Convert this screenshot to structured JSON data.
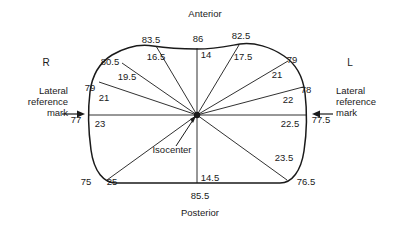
{
  "figure": {
    "type": "body-contour-diagram",
    "orientation_labels": {
      "anterior": "Anterior",
      "posterior": "Posterior",
      "right": "R",
      "left": "L"
    },
    "isocenter_label": "Isocenter",
    "reference_marks": {
      "left": {
        "line1": "Lateral",
        "line2": "reference",
        "line3": "mark",
        "value": "77"
      },
      "right": {
        "line1": "Lateral",
        "line2": "reference",
        "line3": "mark",
        "value": "77.5"
      }
    },
    "outer_measurements": [
      {
        "name": "anterior-left-outer-80_5",
        "value": "80.5"
      },
      {
        "name": "anterior-left-outer-83_5",
        "value": "83.5"
      },
      {
        "name": "anterior-top-86",
        "value": "86"
      },
      {
        "name": "anterior-right-outer-82_5",
        "value": "82.5"
      },
      {
        "name": "anterior-right-outer-79",
        "value": "79"
      },
      {
        "name": "lateral-left-79",
        "value": "79"
      },
      {
        "name": "lateral-right-78",
        "value": "78"
      },
      {
        "name": "posterior-left-75",
        "value": "75"
      },
      {
        "name": "posterior-bottom-85_5",
        "value": "85.5"
      },
      {
        "name": "posterior-right-76_5",
        "value": "76.5"
      }
    ],
    "inner_measurements": [
      {
        "name": "ray-16_5",
        "value": "16.5"
      },
      {
        "name": "ray-14-anterior",
        "value": "14"
      },
      {
        "name": "ray-17_5",
        "value": "17.5"
      },
      {
        "name": "ray-19_5",
        "value": "19.5"
      },
      {
        "name": "ray-21-left",
        "value": "21"
      },
      {
        "name": "ray-21-right",
        "value": "21"
      },
      {
        "name": "ray-22",
        "value": "22"
      },
      {
        "name": "ray-23-left",
        "value": "23"
      },
      {
        "name": "ray-22_5-right",
        "value": "22.5"
      },
      {
        "name": "ray-25-posterior-left",
        "value": "25"
      },
      {
        "name": "ray-14_5-posterior",
        "value": "14.5"
      },
      {
        "name": "ray-23_5-posterior-right",
        "value": "23.5"
      }
    ],
    "colors": {
      "stroke": "#1a1a1a",
      "background": "#ffffff",
      "text": "#1a1a1a"
    }
  }
}
